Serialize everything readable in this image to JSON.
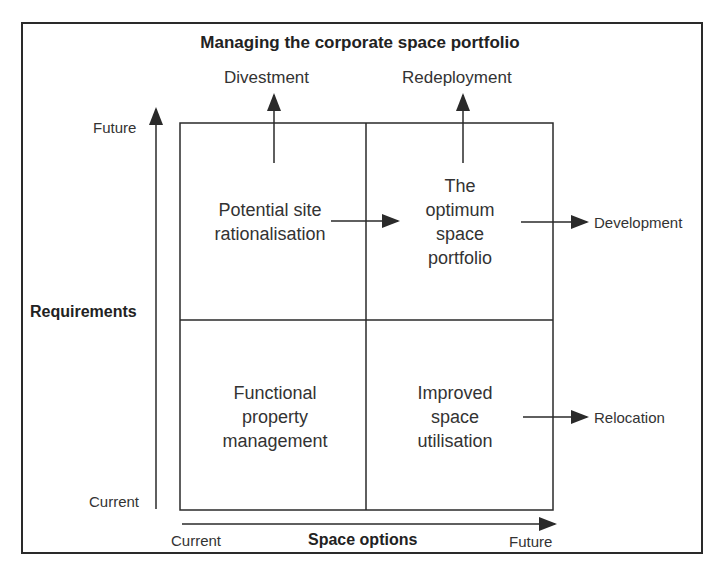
{
  "title": "Managing the corporate space portfolio",
  "outcomes": {
    "top_left": "Divestment",
    "top_right": "Redeployment",
    "right_upper": "Development",
    "right_lower": "Relocation"
  },
  "quadrants": {
    "top_left": "Potential site rationalisation",
    "top_right": "The optimum space portfolio",
    "bottom_left": "Functional property management",
    "bottom_right": "Improved space utilisation"
  },
  "y_axis": {
    "title": "Requirements",
    "top_label": "Future",
    "bottom_label": "Current"
  },
  "x_axis": {
    "title": "Space options",
    "left_label": "Current",
    "right_label": "Future"
  },
  "colors": {
    "line": "#2a2a2a",
    "text": "#333333",
    "background": "#ffffff"
  }
}
